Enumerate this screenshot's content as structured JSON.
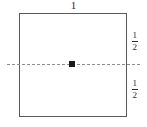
{
  "figure": {
    "title": "",
    "shape": "square"
  },
  "labels": {
    "top_width": "1",
    "upper_half": {
      "numerator": "1",
      "denominator": "2"
    },
    "lower_half": {
      "numerator": "1",
      "denominator": "2"
    }
  },
  "chart_data": {
    "type": "diagram",
    "shape": "square",
    "side_length": 1,
    "annotations": [
      {
        "name": "top-width",
        "text": "1",
        "position": "top",
        "value": 1
      },
      {
        "name": "upper-half-height",
        "text": "1/2",
        "position": "right-upper",
        "value": 0.5
      },
      {
        "name": "lower-half-height",
        "text": "1/2",
        "position": "right-lower",
        "value": 0.5
      }
    ],
    "markers": [
      {
        "name": "center-point",
        "x": 0.5,
        "y": 0.5,
        "style": "filled-square-dot"
      }
    ],
    "lines": [
      {
        "name": "horizontal-symmetry-axis",
        "style": "dashed",
        "orientation": "horizontal",
        "y": 0.5
      }
    ],
    "colors": {
      "outline": "#5a5a5a",
      "dashed_line": "#8d8d8d",
      "marker": "#1a1a1a",
      "text": "#2b2b2b",
      "background": "#ffffff"
    }
  }
}
